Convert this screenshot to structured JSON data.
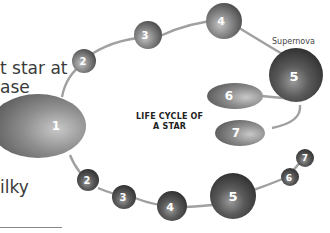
{
  "diagram": {
    "title_line1": "LIFE CYCLE OF",
    "title_line2": "A STAR",
    "annotation_supernova": "Supernova",
    "side_text": {
      "line1": "t star at",
      "line2": "ase",
      "line3": "ilky"
    },
    "upper_path": [
      {
        "id": "1",
        "label": "1",
        "shape": "ellipse"
      },
      {
        "id": "2",
        "label": "2",
        "shape": "sphere"
      },
      {
        "id": "3",
        "label": "3",
        "shape": "sphere"
      },
      {
        "id": "4",
        "label": "4",
        "shape": "sphere"
      },
      {
        "id": "5",
        "label": "5",
        "shape": "sphere",
        "note": "Supernova"
      },
      {
        "id": "6",
        "label": "6",
        "shape": "ellipse"
      },
      {
        "id": "7",
        "label": "7",
        "shape": "ellipse"
      }
    ],
    "lower_path": [
      {
        "id": "2",
        "label": "2",
        "shape": "sphere"
      },
      {
        "id": "3",
        "label": "3",
        "shape": "sphere"
      },
      {
        "id": "4",
        "label": "4",
        "shape": "sphere"
      },
      {
        "id": "5",
        "label": "5",
        "shape": "sphere"
      },
      {
        "id": "6",
        "label": "6",
        "shape": "sphere"
      },
      {
        "id": "7",
        "label": "7",
        "shape": "sphere"
      }
    ],
    "colors": {
      "sphere_light": "#b8b8b8",
      "sphere_mid": "#7a7a7a",
      "sphere_dark": "#3e3e3e",
      "connector": "#9a9a9a",
      "text": "#333333"
    }
  }
}
